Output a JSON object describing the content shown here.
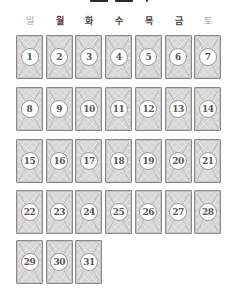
{
  "header": {
    "title_clipped": true
  },
  "weekdays": [
    {
      "label": "일",
      "type": "weekend"
    },
    {
      "label": "월",
      "type": "weekday"
    },
    {
      "label": "화",
      "type": "weekday"
    },
    {
      "label": "수",
      "type": "weekday"
    },
    {
      "label": "목",
      "type": "weekday"
    },
    {
      "label": "금",
      "type": "weekday"
    },
    {
      "label": "토",
      "type": "weekend"
    }
  ],
  "days": [
    "1",
    "2",
    "3",
    "4",
    "5",
    "6",
    "7",
    "8",
    "9",
    "10",
    "11",
    "12",
    "13",
    "14",
    "15",
    "16",
    "17",
    "18",
    "19",
    "20",
    "21",
    "22",
    "23",
    "24",
    "25",
    "26",
    "27",
    "28",
    "29",
    "30",
    "31"
  ],
  "colors": {
    "card_bg": "#d6d6d6",
    "card_border": "#8a8a8a",
    "weekend_label": "#9a9a9a",
    "weekday_label": "#444444",
    "number": "#555555"
  }
}
